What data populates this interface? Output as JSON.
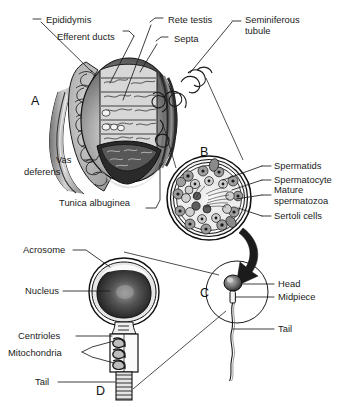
{
  "figure": {
    "background": "#ffffff",
    "ink": "#1b1b1b"
  },
  "panels": [
    {
      "id": "A",
      "letter": "A",
      "caption": "Testis, epididymis and vas deferens (sagittal cut)"
    },
    {
      "id": "B",
      "letter": "B",
      "caption": "Seminiferous tubule cross-section"
    },
    {
      "id": "C",
      "letter": "C",
      "caption": "Whole spermatozoon"
    },
    {
      "id": "D",
      "letter": "D",
      "caption": "Spermatozoon structure detail"
    }
  ],
  "labels": {
    "panel_a": [
      {
        "name": "epididymis",
        "text": "Epididymis"
      },
      {
        "name": "efferent-ducts",
        "text": "Efferent ducts"
      },
      {
        "name": "rete-testis",
        "text": "Rete testis"
      },
      {
        "name": "septa",
        "text": "Septa"
      },
      {
        "name": "seminiferous-tubule-line1",
        "text": "Seminiferous"
      },
      {
        "name": "seminiferous-tubule-line2",
        "text": "tubule"
      },
      {
        "name": "vas-deferens-line1",
        "text": "Vas"
      },
      {
        "name": "vas-deferens-line2",
        "text": "deferens"
      },
      {
        "name": "tunica-albuginea",
        "text": "Tunica albuginea"
      }
    ],
    "panel_b": [
      {
        "name": "spermatids",
        "text": "Spermatids"
      },
      {
        "name": "spermatocyte",
        "text": "Spermatocyte"
      },
      {
        "name": "mature-spermatozoa-line1",
        "text": "Mature"
      },
      {
        "name": "mature-spermatozoa-line2",
        "text": "spermatozoa"
      },
      {
        "name": "sertoli-cells",
        "text": "Sertoli cells"
      }
    ],
    "panel_c": [
      {
        "name": "head",
        "text": "Head"
      },
      {
        "name": "midpiece",
        "text": "Midpiece"
      },
      {
        "name": "tail",
        "text": "Tail"
      }
    ],
    "panel_d": [
      {
        "name": "acrosome",
        "text": "Acrosome"
      },
      {
        "name": "nucleus",
        "text": "Nucleus"
      },
      {
        "name": "centrioles",
        "text": "Centrioles"
      },
      {
        "name": "mitochondria",
        "text": "Mitochondria"
      },
      {
        "name": "tail",
        "text": "Tail"
      }
    ]
  }
}
